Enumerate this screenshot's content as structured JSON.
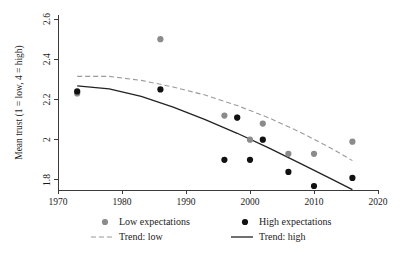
{
  "chart_data": {
    "type": "scatter",
    "title": "",
    "xlabel": "",
    "ylabel": "Mean trust (1 = low, 4 = high)",
    "xlim": [
      1970,
      2020
    ],
    "ylim": [
      1.75,
      2.62
    ],
    "grid": false,
    "legend_position": "bottom",
    "x_ticks": [
      1970,
      1980,
      1990,
      2000,
      2010,
      2020
    ],
    "x_tick_labels": [
      "1970",
      "1980",
      "1990",
      "2000",
      "2010",
      "2020"
    ],
    "y_ticks": [
      1.8,
      2.0,
      2.2,
      2.4,
      2.6
    ],
    "y_tick_labels": [
      "1.8",
      "2",
      "2.2",
      "2.4",
      "2.6"
    ],
    "series": [
      {
        "name": "Low expectations",
        "type": "scatter",
        "marker": "circle",
        "color": "#8b8b8b",
        "points": [
          {
            "x": 1973,
            "y": 2.23
          },
          {
            "x": 1986,
            "y": 2.5
          },
          {
            "x": 1996,
            "y": 2.12
          },
          {
            "x": 1998,
            "y": 2.11
          },
          {
            "x": 2000,
            "y": 2.0
          },
          {
            "x": 2002,
            "y": 2.08
          },
          {
            "x": 2006,
            "y": 1.93
          },
          {
            "x": 2010,
            "y": 1.93
          },
          {
            "x": 2016,
            "y": 1.99
          }
        ]
      },
      {
        "name": "High expectations",
        "type": "scatter",
        "marker": "circle",
        "color": "#111111",
        "points": [
          {
            "x": 1973,
            "y": 2.24
          },
          {
            "x": 1986,
            "y": 2.25
          },
          {
            "x": 1996,
            "y": 1.9
          },
          {
            "x": 1998,
            "y": 2.11
          },
          {
            "x": 2000,
            "y": 1.9
          },
          {
            "x": 2002,
            "y": 2.0
          },
          {
            "x": 2006,
            "y": 1.84
          },
          {
            "x": 2010,
            "y": 1.77
          },
          {
            "x": 2016,
            "y": 1.81
          }
        ]
      },
      {
        "name": "Trend: low",
        "type": "line",
        "style": "dashed",
        "color": "#9a9a9a",
        "points": [
          {
            "x": 1973,
            "y": 2.315
          },
          {
            "x": 1978,
            "y": 2.315
          },
          {
            "x": 1983,
            "y": 2.295
          },
          {
            "x": 1988,
            "y": 2.262
          },
          {
            "x": 1993,
            "y": 2.222
          },
          {
            "x": 1998,
            "y": 2.17
          },
          {
            "x": 2003,
            "y": 2.108
          },
          {
            "x": 2008,
            "y": 2.035
          },
          {
            "x": 2013,
            "y": 1.952
          },
          {
            "x": 2016,
            "y": 1.896
          }
        ]
      },
      {
        "name": "Trend: high",
        "type": "line",
        "style": "solid",
        "color": "#222222",
        "points": [
          {
            "x": 1973,
            "y": 2.268
          },
          {
            "x": 1978,
            "y": 2.253
          },
          {
            "x": 1983,
            "y": 2.215
          },
          {
            "x": 1988,
            "y": 2.162
          },
          {
            "x": 1993,
            "y": 2.1
          },
          {
            "x": 1998,
            "y": 2.032
          },
          {
            "x": 2003,
            "y": 1.958
          },
          {
            "x": 2008,
            "y": 1.88
          },
          {
            "x": 2013,
            "y": 1.8
          },
          {
            "x": 2016,
            "y": 1.752
          }
        ]
      }
    ]
  },
  "legend": {
    "items": [
      {
        "label": "Low expectations",
        "marker": "dot-gray"
      },
      {
        "label": "High expectations",
        "marker": "dot-black"
      },
      {
        "label": "Trend: low",
        "marker": "dashed-line-gray"
      },
      {
        "label": "Trend: high",
        "marker": "solid-line-black"
      }
    ]
  }
}
